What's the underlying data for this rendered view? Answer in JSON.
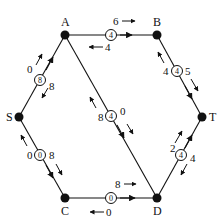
{
  "diagram": {
    "type": "flow-network-residual",
    "nodes": [
      {
        "id": "S",
        "label": "S",
        "x": 19,
        "y": 117,
        "lx": 8,
        "ly": 121
      },
      {
        "id": "A",
        "label": "A",
        "x": 65,
        "y": 35,
        "lx": 60,
        "ly": 26
      },
      {
        "id": "B",
        "label": "B",
        "x": 157,
        "y": 35,
        "lx": 152,
        "ly": 26
      },
      {
        "id": "T",
        "label": "T",
        "x": 202,
        "y": 117,
        "lx": 208,
        "ly": 121
      },
      {
        "id": "C",
        "label": "C",
        "x": 65,
        "y": 198,
        "lx": 60,
        "ly": 214
      },
      {
        "id": "D",
        "label": "D",
        "x": 157,
        "y": 198,
        "lx": 152,
        "ly": 214
      }
    ],
    "edges": [
      {
        "id": "S-A",
        "from": "S",
        "to": "A",
        "flow": "8",
        "forward_residual": "0",
        "backward_residual": "8"
      },
      {
        "id": "A-B",
        "from": "A",
        "to": "B",
        "flow": "4",
        "forward_residual": "6",
        "backward_residual": "4"
      },
      {
        "id": "B-T",
        "from": "B",
        "to": "T",
        "flow": "4",
        "forward_residual": "5",
        "backward_residual": "4"
      },
      {
        "id": "A-D",
        "from": "A",
        "to": "D",
        "flow": "4",
        "forward_residual": "0",
        "backward_residual": "8"
      },
      {
        "id": "S-C",
        "from": "S",
        "to": "C",
        "flow": "0",
        "forward_residual": "8",
        "backward_residual": "0"
      },
      {
        "id": "C-D",
        "from": "C",
        "to": "D",
        "flow": "0",
        "forward_residual": "8",
        "backward_residual": "0"
      },
      {
        "id": "D-T",
        "from": "D",
        "to": "T",
        "flow": "4",
        "forward_residual": "2",
        "backward_residual": "4"
      }
    ]
  }
}
